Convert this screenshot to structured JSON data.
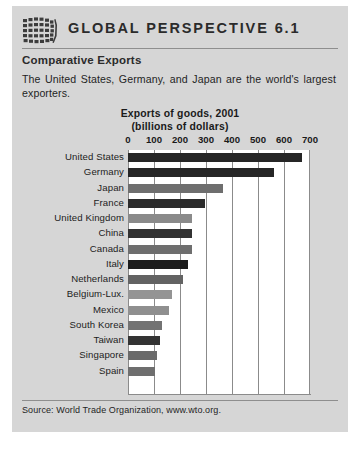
{
  "banner": {
    "icon": "globe-grid-icon",
    "title": "GLOBAL PERSPECTIVE 6.1"
  },
  "subtitle": "Comparative Exports",
  "intro": "The United States, Germany, and Japan are the world's largest exporters.",
  "source": "Source: World Trade Organization, www.wto.org.",
  "colors": {
    "panel_background": "#d6d6d6",
    "plot_background": "#ffffff",
    "bar_dark": "#262626",
    "bar_medium": "#6e6e6e",
    "bar_light": "#949494",
    "gridline": "#8b8b8b",
    "text": "#1a1a1a"
  },
  "chart_data": {
    "type": "bar",
    "orientation": "horizontal",
    "title": "Exports of goods, 2001",
    "subtitle": "(billions of dollars)",
    "xlabel": "",
    "ylabel": "",
    "xlim": [
      0,
      700
    ],
    "xticks": [
      0,
      100,
      200,
      300,
      400,
      500,
      600,
      700
    ],
    "ticklabels": [
      "0",
      "100",
      "200",
      "300",
      "400",
      "500",
      "600",
      "700"
    ],
    "grid": true,
    "legend": false,
    "categories": [
      "United States",
      "Germany",
      "Japan",
      "France",
      "United Kingdom",
      "China",
      "Canada",
      "Italy",
      "Netherlands",
      "Belgium-Lux.",
      "Mexico",
      "South Korea",
      "Taiwan",
      "Singapore",
      "Spain"
    ],
    "values": [
      670,
      560,
      365,
      295,
      245,
      245,
      245,
      232,
      212,
      170,
      158,
      132,
      122,
      113,
      105
    ],
    "bar_colors": [
      "#262626",
      "#262626",
      "#6e6e6e",
      "#2b2b2b",
      "#8a8a8a",
      "#323232",
      "#6e6e6e",
      "#1c1c1c",
      "#636363",
      "#949494",
      "#8f8f8f",
      "#737373",
      "#333333",
      "#6a6a6a",
      "#6e6e6e"
    ]
  }
}
